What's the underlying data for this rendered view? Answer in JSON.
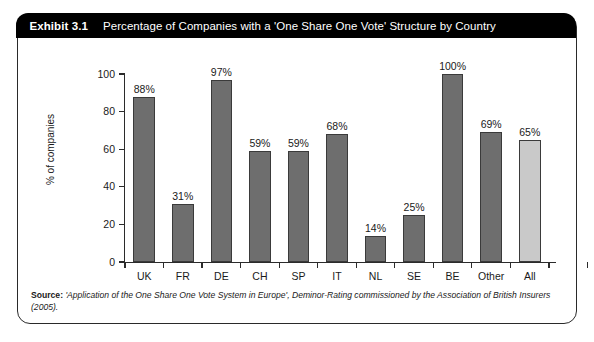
{
  "exhibit": {
    "number": "Exhibit 3.1",
    "title": "Percentage of Companies with a 'One Share One Vote' Structure by Country"
  },
  "source": {
    "label": "Source:",
    "text": "'Application of the One Share One Vote System in Europe', Deminor-Rating commissioned by the Association of British Insurers (2005)."
  },
  "colors": {
    "bar_dark": "#6e6e6e",
    "bar_light": "#c9c9c9",
    "bar_edge": "#3a3a3a",
    "header_bg": "#000000",
    "header_text": "#ffffff",
    "frame": "#2a2a2a"
  },
  "chart_data": {
    "type": "bar",
    "title": "Percentage of Companies with a 'One Share One Vote' Structure by Country",
    "xlabel": "",
    "ylabel": "% of companies",
    "categories": [
      "UK",
      "FR",
      "DE",
      "CH",
      "SP",
      "IT",
      "NL",
      "SE",
      "BE",
      "Other",
      "All"
    ],
    "values": [
      88,
      31,
      97,
      59,
      59,
      68,
      14,
      25,
      100,
      69,
      65
    ],
    "value_labels": [
      "88%",
      "31%",
      "97%",
      "59%",
      "59%",
      "68%",
      "14%",
      "25%",
      "100%",
      "69%",
      "65%"
    ],
    "bar_styles": [
      "dark",
      "dark",
      "dark",
      "dark",
      "dark",
      "dark",
      "dark",
      "dark",
      "dark",
      "dark",
      "light"
    ],
    "ylim": [
      0,
      100
    ],
    "yticks": [
      0,
      20,
      40,
      60,
      80,
      100
    ],
    "ytick_labels": [
      "0",
      "20",
      "40",
      "60",
      "80",
      "100"
    ],
    "grid": false,
    "legend": false
  }
}
